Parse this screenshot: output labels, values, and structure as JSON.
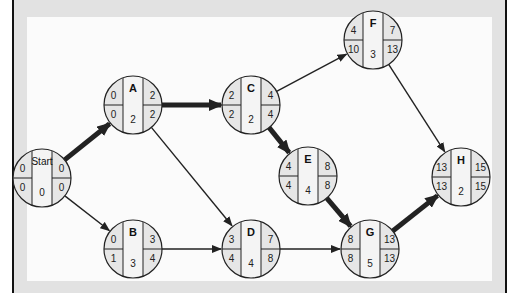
{
  "diagram": {
    "type": "activity-on-node network (critical path)",
    "colors": {
      "node_fill_side": "#e6e6e6",
      "node_fill_center": "#f4f4f4",
      "stroke": "#222222",
      "critical_arrow": "#222222"
    },
    "nodes": [
      {
        "id": "Start",
        "label": "Start",
        "cx": 42,
        "cy": 178,
        "es": "0",
        "ef": "0",
        "ls": "0",
        "lf": "0",
        "duration": "0"
      },
      {
        "id": "A",
        "label": "A",
        "cx": 133,
        "cy": 105,
        "es": "0",
        "ef": "2",
        "ls": "0",
        "lf": "2",
        "duration": "2"
      },
      {
        "id": "B",
        "label": "B",
        "cx": 133,
        "cy": 249,
        "es": "0",
        "ef": "3",
        "ls": "1",
        "lf": "4",
        "duration": "3"
      },
      {
        "id": "C",
        "label": "C",
        "cx": 251,
        "cy": 105,
        "es": "2",
        "ef": "4",
        "ls": "2",
        "lf": "4",
        "duration": "2"
      },
      {
        "id": "D",
        "label": "D",
        "cx": 251,
        "cy": 249,
        "es": "3",
        "ef": "7",
        "ls": "4",
        "lf": "8",
        "duration": "4"
      },
      {
        "id": "E",
        "label": "E",
        "cx": 308,
        "cy": 176,
        "es": "4",
        "ef": "8",
        "ls": "4",
        "lf": "8",
        "duration": "4"
      },
      {
        "id": "F",
        "label": "F",
        "cx": 373,
        "cy": 40,
        "es": "4",
        "ef": "7",
        "ls": "10",
        "lf": "13",
        "duration": "3"
      },
      {
        "id": "G",
        "label": "G",
        "cx": 370,
        "cy": 249,
        "es": "8",
        "ef": "13",
        "ls": "8",
        "lf": "13",
        "duration": "5"
      },
      {
        "id": "H",
        "label": "H",
        "cx": 461,
        "cy": 177,
        "es": "13",
        "ef": "15",
        "ls": "13",
        "lf": "15",
        "duration": "2"
      }
    ],
    "edges": [
      {
        "from": "Start",
        "to": "A",
        "critical": true
      },
      {
        "from": "Start",
        "to": "B",
        "critical": false
      },
      {
        "from": "A",
        "to": "C",
        "critical": true
      },
      {
        "from": "A",
        "to": "D",
        "critical": false
      },
      {
        "from": "B",
        "to": "D",
        "critical": false
      },
      {
        "from": "C",
        "to": "E",
        "critical": true
      },
      {
        "from": "C",
        "to": "F",
        "critical": false
      },
      {
        "from": "E",
        "to": "G",
        "critical": true
      },
      {
        "from": "D",
        "to": "G",
        "critical": false
      },
      {
        "from": "F",
        "to": "H",
        "critical": false
      },
      {
        "from": "G",
        "to": "H",
        "critical": true
      }
    ]
  }
}
